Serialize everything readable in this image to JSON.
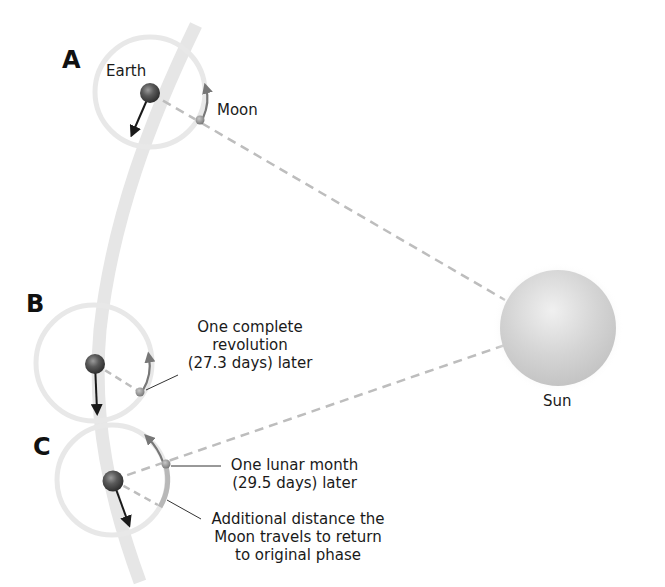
{
  "positions": {
    "a": {
      "letter": "A"
    },
    "b": {
      "letter": "B"
    },
    "c": {
      "letter": "C"
    }
  },
  "labels": {
    "earth": "Earth",
    "moon": "Moon",
    "sun": "Sun",
    "revolution_line1": "One complete",
    "revolution_line2": "revolution",
    "revolution_line3": "(27.3 days) later",
    "lunar_line1": "One lunar month",
    "lunar_line2": "(29.5 days) later",
    "additional_line1": "Additional distance the",
    "additional_line2": "Moon travels to return",
    "additional_line3": "to original phase"
  },
  "colors": {
    "orbit_band": "#e6e6e6",
    "moon_orbit": "#e8e8e8",
    "dashed_line": "#bdbdbd",
    "earth": "#555555",
    "moon": "#8a8a8a",
    "sun": "#d6d6d6",
    "arrow": "#1a1a1a",
    "moon_arrow": "#777777"
  }
}
